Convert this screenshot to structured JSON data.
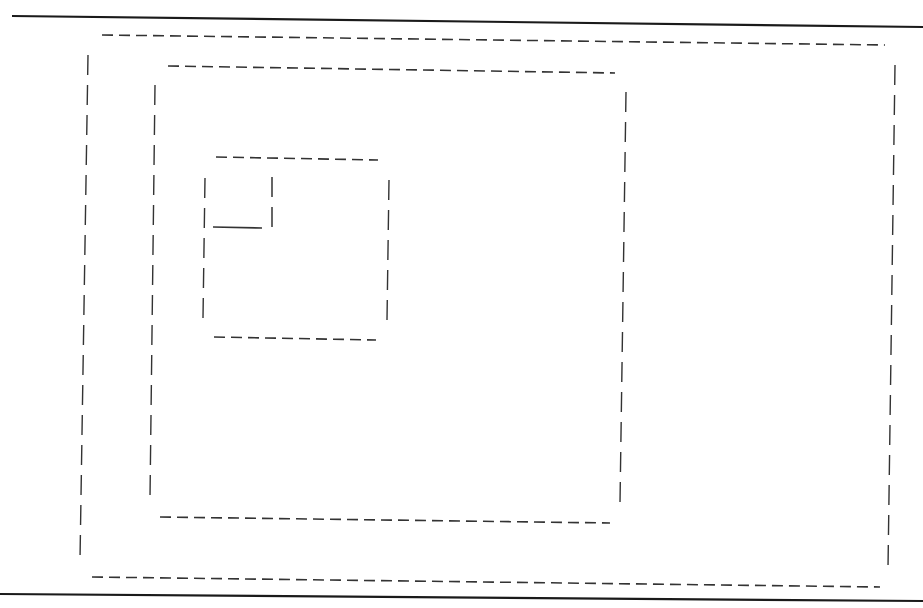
{
  "diagram": {
    "colors": {
      "background": "#ffffff",
      "stroke": "#333333",
      "rule": "#1a1a1a"
    },
    "rules": [
      {
        "id": "top-rule",
        "x1": 12,
        "y1": 16,
        "x2": 923,
        "y2": 27
      },
      {
        "id": "bottom-rule",
        "x1": 0,
        "y1": 594,
        "x2": 923,
        "y2": 601
      }
    ],
    "boxes": [
      {
        "id": "outer-box",
        "top": {
          "x1": 102,
          "y1": 35,
          "x2": 885,
          "y2": 45
        },
        "bottom": {
          "x1": 92,
          "y1": 577,
          "x2": 880,
          "y2": 587
        },
        "left": {
          "x1": 88,
          "y1": 55,
          "x2": 80,
          "y2": 560
        },
        "right": {
          "x1": 895,
          "y1": 65,
          "x2": 888,
          "y2": 568
        }
      },
      {
        "id": "middle-box",
        "top": {
          "x1": 168,
          "y1": 66,
          "x2": 615,
          "y2": 73
        },
        "bottom": {
          "x1": 160,
          "y1": 517,
          "x2": 610,
          "y2": 523
        },
        "left": {
          "x1": 155,
          "y1": 85,
          "x2": 150,
          "y2": 498
        },
        "right": {
          "x1": 626,
          "y1": 92,
          "x2": 620,
          "y2": 503
        }
      },
      {
        "id": "inner-box",
        "top": {
          "x1": 216,
          "y1": 157,
          "x2": 378,
          "y2": 160
        },
        "bottom": {
          "x1": 214,
          "y1": 337,
          "x2": 376,
          "y2": 340
        },
        "left": {
          "x1": 205,
          "y1": 178,
          "x2": 203,
          "y2": 318
        },
        "right": {
          "x1": 389,
          "y1": 180,
          "x2": 387,
          "y2": 320
        }
      }
    ],
    "corner_mark": {
      "id": "corner-notch",
      "vertical": {
        "x1": 272,
        "y1": 177,
        "x2": 272,
        "y2": 228
      },
      "horizontal": {
        "x1": 213,
        "y1": 227,
        "x2": 262,
        "y2": 228
      }
    },
    "text_labels": []
  }
}
